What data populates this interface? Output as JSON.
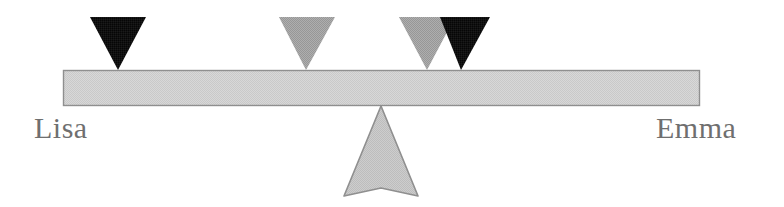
{
  "figure": {
    "type": "balance-scale-diagram",
    "width": 784,
    "height": 207,
    "background_color": "#ffffff"
  },
  "labels": {
    "left": "Lisa",
    "right": "Emma",
    "text_color": "#6f6f6f"
  },
  "beam": {
    "name": "balance-beam",
    "x": 63,
    "y": 70,
    "width": 637,
    "height": 36,
    "fill": "#d4d4d4",
    "stroke": "#8f8f8f"
  },
  "fulcrum": {
    "name": "fulcrum",
    "apex_x": 381,
    "apex_y": 107,
    "left_x": 344,
    "right_x": 418,
    "bottom_y": 196,
    "notch_y": 188,
    "fill": "#c9c9c9",
    "stroke": "#8f8f8f"
  },
  "weights": [
    {
      "id": "weight-1",
      "color_name": "black",
      "fill": "#0d0d0d",
      "left_x": 90,
      "right_x": 146,
      "top_y": 17,
      "apex_x": 118,
      "apex_y": 70
    },
    {
      "id": "weight-2",
      "color_name": "gray",
      "fill": "#a3a3a3",
      "left_x": 279,
      "right_x": 335,
      "top_y": 17,
      "apex_x": 306,
      "apex_y": 70
    },
    {
      "id": "weight-3",
      "color_name": "gray",
      "fill": "#a3a3a3",
      "left_x": 399,
      "right_x": 455,
      "top_y": 17,
      "apex_x": 427,
      "apex_y": 70
    },
    {
      "id": "weight-4",
      "color_name": "black",
      "fill": "#0d0d0d",
      "left_x": 440,
      "right_x": 490,
      "top_y": 17,
      "apex_x": 461,
      "apex_y": 70
    }
  ],
  "chart_data": {
    "type": "diagram",
    "title": "",
    "axis": "position along beam (pixels from left edge of beam)",
    "beam_span_px": [
      63,
      700
    ],
    "fulcrum_position_px": 381,
    "categories": [
      "weight-1",
      "weight-2",
      "weight-3",
      "weight-4"
    ],
    "values": [
      118,
      306,
      427,
      461
    ],
    "series": [
      {
        "name": "weight apex x (px)",
        "values": [
          118,
          306,
          427,
          461
        ]
      },
      {
        "name": "offset from fulcrum (px)",
        "values": [
          -263,
          -75,
          46,
          80
        ]
      }
    ],
    "colors": [
      "#0d0d0d",
      "#a3a3a3",
      "#a3a3a3",
      "#0d0d0d"
    ],
    "endpoint_labels": [
      "Lisa",
      "Emma"
    ],
    "legend": [],
    "grid": false
  }
}
